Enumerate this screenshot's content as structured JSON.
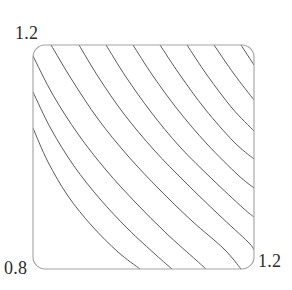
{
  "figure": {
    "type": "streamline-plot",
    "background_color": "#ffffff",
    "frame": {
      "x": 33,
      "y": 45,
      "width": 221,
      "height": 224,
      "corner_radius": 12,
      "stroke_color": "#a3a3a3",
      "stroke_width": 1.1
    },
    "curves": {
      "stroke_color": "#5a5a5a",
      "stroke_width": 1.0,
      "direction": "upper-left to lower-right",
      "count": 10
    }
  },
  "labels": {
    "top_left": "1.2",
    "bottom_left": "0.8",
    "bottom_right": "1.2"
  },
  "chart_data": {
    "type": "line",
    "title": "",
    "xlabel": "",
    "ylabel": "",
    "grid": false,
    "legend": false,
    "axis_corner_labels": {
      "top_left": "1.2",
      "bottom_left": "0.8",
      "bottom_right": "1.2"
    },
    "xlim": [
      0.8,
      1.2
    ],
    "ylim": [
      0.8,
      1.2
    ],
    "x_tick_labels": [
      "0.8",
      "1.2"
    ],
    "y_tick_labels": [
      "0.8",
      "1.2"
    ],
    "series": [
      {
        "name": "streamline-1",
        "path": [
          [
            33,
            128
          ],
          [
            48,
            162
          ],
          [
            68,
            196
          ],
          [
            92,
            226
          ],
          [
            118,
            252
          ],
          [
            140,
            269
          ]
        ]
      },
      {
        "name": "streamline-2",
        "path": [
          [
            33,
            92
          ],
          [
            51,
            129
          ],
          [
            74,
            166
          ],
          [
            100,
            199
          ],
          [
            128,
            229
          ],
          [
            156,
            255
          ],
          [
            172,
            269
          ]
        ]
      },
      {
        "name": "streamline-3",
        "path": [
          [
            33,
            56
          ],
          [
            53,
            95
          ],
          [
            78,
            134
          ],
          [
            106,
            170
          ],
          [
            136,
            203
          ],
          [
            166,
            233
          ],
          [
            196,
            260
          ],
          [
            206,
            269
          ]
        ]
      },
      {
        "name": "streamline-4",
        "path": [
          [
            51,
            45
          ],
          [
            72,
            80
          ],
          [
            98,
            119
          ],
          [
            128,
            156
          ],
          [
            160,
            190
          ],
          [
            192,
            221
          ],
          [
            224,
            249
          ],
          [
            241,
            269
          ]
        ]
      },
      {
        "name": "streamline-5",
        "path": [
          [
            79,
            45
          ],
          [
            99,
            78
          ],
          [
            124,
            114
          ],
          [
            154,
            150
          ],
          [
            186,
            183
          ],
          [
            218,
            214
          ],
          [
            248,
            242
          ],
          [
            254,
            250
          ]
        ]
      },
      {
        "name": "streamline-6",
        "path": [
          [
            106,
            45
          ],
          [
            126,
            77
          ],
          [
            151,
            112
          ],
          [
            180,
            147
          ],
          [
            212,
            179
          ],
          [
            243,
            208
          ],
          [
            254,
            217
          ]
        ]
      },
      {
        "name": "streamline-7",
        "path": [
          [
            133,
            45
          ],
          [
            153,
            76
          ],
          [
            178,
            110
          ],
          [
            207,
            144
          ],
          [
            238,
            175
          ],
          [
            254,
            188
          ]
        ]
      },
      {
        "name": "streamline-8",
        "path": [
          [
            160,
            45
          ],
          [
            180,
            75
          ],
          [
            205,
            109
          ],
          [
            234,
            142
          ],
          [
            254,
            159
          ]
        ]
      },
      {
        "name": "streamline-9",
        "path": [
          [
            187,
            45
          ],
          [
            207,
            75
          ],
          [
            232,
            108
          ],
          [
            254,
            131
          ]
        ]
      },
      {
        "name": "streamline-10",
        "path": [
          [
            214,
            45
          ],
          [
            234,
            74
          ],
          [
            254,
            100
          ]
        ]
      },
      {
        "name": "streamline-11",
        "path": [
          [
            241,
            45
          ],
          [
            254,
            65
          ]
        ]
      }
    ]
  }
}
